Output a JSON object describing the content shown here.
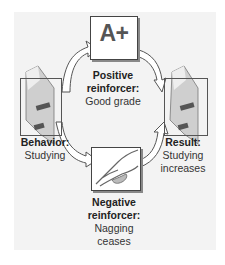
{
  "diagram": {
    "type": "cycle",
    "nodes": {
      "behavior": {
        "title": "Behavior:",
        "detail": "Studying",
        "icon": "book-icon"
      },
      "positive": {
        "title": "Positive",
        "title2": "reinforcer:",
        "detail": "Good grade",
        "icon_text": "A+"
      },
      "negative": {
        "title": "Negative",
        "title2": "reinforcer:",
        "detail": "Nagging",
        "detail2": "ceases",
        "icon": "pointing-hand-icon"
      },
      "result": {
        "title": "Result:",
        "detail": "Studying",
        "detail2": "increases",
        "icon": "book-icon"
      }
    },
    "edges": [
      {
        "from": "behavior",
        "to": "positive"
      },
      {
        "from": "positive",
        "to": "result"
      },
      {
        "from": "behavior",
        "to": "negative"
      },
      {
        "from": "negative",
        "to": "result"
      }
    ],
    "colors": {
      "panel": "#f3f3f3",
      "arrow_fill": "#ffffff",
      "arrow_stroke": "#555555",
      "book_light": "#d8d8d8",
      "book_dark": "#555555"
    }
  }
}
